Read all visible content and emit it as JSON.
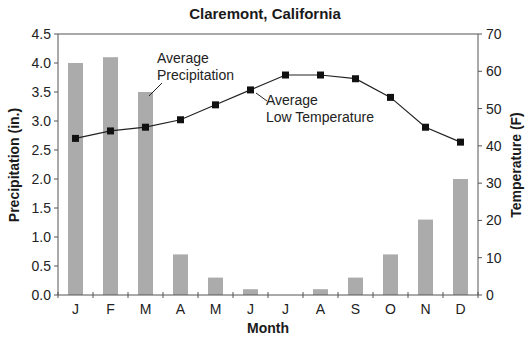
{
  "chart_data": {
    "type": "bar+line",
    "title": "Claremont, California",
    "xlabel": "Month",
    "ylabel_left": "Precipitation (in.)",
    "ylabel_right": "Temperature (F)",
    "categories": [
      "J",
      "F",
      "M",
      "A",
      "M",
      "J",
      "J",
      "A",
      "S",
      "O",
      "N",
      "D"
    ],
    "ylim_left": [
      0,
      4.5
    ],
    "ylim_right": [
      0,
      70
    ],
    "yticks_left": [
      "0.0",
      "0.5",
      "1.0",
      "1.5",
      "2.0",
      "2.5",
      "3.0",
      "3.5",
      "4.0",
      "4.5"
    ],
    "yticks_right": [
      "0",
      "10",
      "20",
      "30",
      "40",
      "50",
      "60",
      "70"
    ],
    "grid": false,
    "series": [
      {
        "name": "Average Precipitation",
        "type": "bar",
        "axis": "left",
        "color": "#ababab",
        "values": [
          4.0,
          4.1,
          3.5,
          0.7,
          0.3,
          0.1,
          0.0,
          0.1,
          0.3,
          0.7,
          1.3,
          2.0
        ]
      },
      {
        "name": "Average Low Temperature",
        "type": "line",
        "axis": "right",
        "color": "#111111",
        "marker": "square",
        "values": [
          42,
          44,
          45,
          47,
          51,
          55,
          59,
          59,
          58,
          53,
          45,
          41
        ]
      }
    ],
    "annotations": [
      {
        "lines": [
          "Average",
          "Precipitation"
        ],
        "target": "bar-M-3",
        "series": "Average Precipitation"
      },
      {
        "lines": [
          "Average",
          "Low Temperature"
        ],
        "target": "marker-J-6",
        "series": "Average Low Temperature"
      }
    ]
  }
}
